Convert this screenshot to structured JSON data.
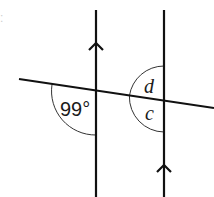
{
  "diagram": {
    "title_fragment": ":",
    "colors": {
      "stroke": "#111111",
      "arc": "#333333",
      "background": "#ffffff"
    },
    "lines": {
      "transversal": {
        "x1": 19,
        "y1": 79,
        "x2": 214,
        "y2": 108
      },
      "parallel_left": {
        "x1": 96,
        "y1": 10,
        "x2": 96,
        "y2": 197
      },
      "parallel_right": {
        "x1": 164,
        "y1": 10,
        "x2": 164,
        "y2": 197
      }
    },
    "parallel_markers": [
      {
        "name": "arrow-up-left-line",
        "x": 96,
        "y": 47
      },
      {
        "name": "arrow-up-right-line",
        "x": 164,
        "y": 170
      }
    ],
    "angles": [
      {
        "id": "given",
        "label": "99°",
        "position": "left intersection, lower-left"
      },
      {
        "id": "d",
        "label": "d",
        "position": "right intersection, upper-left"
      },
      {
        "id": "c",
        "label": "c",
        "position": "right intersection, lower-left"
      }
    ]
  }
}
